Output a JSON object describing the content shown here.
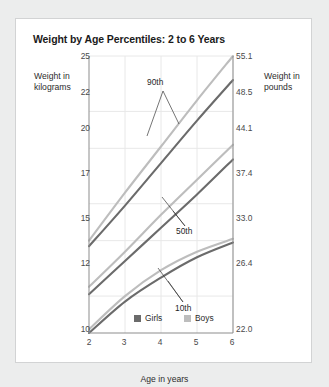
{
  "card": {
    "title": "Weight by Age Percentiles: 2 to 6 Years"
  },
  "axes": {
    "left_title": "Weight in kilograms",
    "right_title": "Weight in pounds",
    "x_title": "Age in years"
  },
  "legend": {
    "girls": "Girls",
    "boys": "Boys",
    "girls_color": "#6b6b6b",
    "boys_color": "#bdbdbd"
  },
  "annotations": {
    "p90": "90th",
    "p50": "50th",
    "p10": "10th"
  },
  "chart_data": {
    "type": "line",
    "title": "Weight by Age Percentiles: 2 to 6 Years",
    "xlabel": "Age in years",
    "ylabel": "Weight in kilograms",
    "ylabel_right": "Weight in pounds",
    "x": [
      2,
      3,
      4,
      5,
      6
    ],
    "xlim": [
      2,
      6
    ],
    "xticks": [
      "2",
      "3",
      "4",
      "5",
      "6"
    ],
    "ylim": [
      10,
      25
    ],
    "yticks_left": [
      "10",
      "12",
      "15",
      "17",
      "20",
      "22",
      "25"
    ],
    "yticks_left_values": [
      10,
      12,
      15,
      17,
      20,
      22,
      25
    ],
    "yticks_right": [
      "22.0",
      "26.4",
      "33.0",
      "37.4",
      "44.1",
      "48.5",
      "55.1"
    ],
    "yticks_right_values": [
      22.0,
      26.4,
      33.0,
      37.4,
      44.1,
      48.5,
      55.1
    ],
    "grid": true,
    "legend_position": "bottom-center",
    "series": [
      {
        "name": "Boys 90th",
        "percentile": "90th",
        "sex": "Boys",
        "color": "#bdbdbd",
        "values": [
          15.0,
          17.6,
          20.1,
          22.6,
          25.0
        ]
      },
      {
        "name": "Girls 90th",
        "percentile": "90th",
        "sex": "Girls",
        "color": "#6b6b6b",
        "values": [
          14.7,
          16.9,
          19.2,
          21.5,
          23.7
        ]
      },
      {
        "name": "Boys 50th",
        "percentile": "50th",
        "sex": "Boys",
        "color": "#bdbdbd",
        "values": [
          12.5,
          14.4,
          16.4,
          18.3,
          20.2
        ]
      },
      {
        "name": "Girls 50th",
        "percentile": "50th",
        "sex": "Girls",
        "color": "#6b6b6b",
        "values": [
          12.1,
          13.9,
          15.7,
          17.5,
          19.4
        ]
      },
      {
        "name": "Boys 10th",
        "percentile": "10th",
        "sex": "Boys",
        "color": "#bdbdbd",
        "values": [
          10.2,
          12.0,
          13.4,
          14.4,
          15.1
        ]
      },
      {
        "name": "Girls 10th",
        "percentile": "10th",
        "sex": "Girls",
        "color": "#6b6b6b",
        "values": [
          10.0,
          11.7,
          13.0,
          14.1,
          14.9
        ]
      }
    ]
  }
}
